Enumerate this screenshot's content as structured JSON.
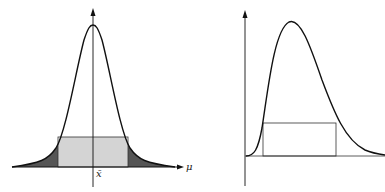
{
  "figures": [
    {
      "id": "left",
      "description": "Symmetric bell-shaped curve centered on vertical axis with a light-gray central rectangle and dark-shaded tails",
      "labels": {
        "x_axis": "μ",
        "center_tick": "x̄"
      },
      "colors": {
        "rect_fill": "#d4d4d4",
        "tail_fill": "#555555",
        "stroke": "#111111"
      }
    },
    {
      "id": "right",
      "description": "Right-skewed unimodal curve with an unfilled rectangle under it",
      "labels": {},
      "colors": {
        "stroke": "#111111"
      }
    }
  ]
}
